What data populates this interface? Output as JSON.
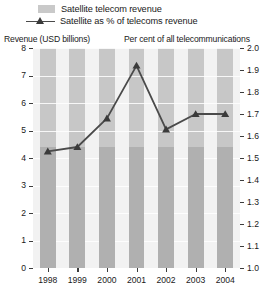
{
  "legend": {
    "items": [
      {
        "label": "Satellite telecom revenue",
        "marker": "bar-swatch"
      },
      {
        "label": "Satellite as % of telecoms revenue",
        "marker": "line-triangle-marker"
      }
    ]
  },
  "axes": {
    "left_caption": "Revenue (USD billions)",
    "right_caption": "Per cent of all telecommunications",
    "left_ticks": [
      "0",
      "1",
      "2",
      "3",
      "4",
      "5",
      "6",
      "7",
      "8"
    ],
    "right_ticks": [
      "1.0",
      "1.1",
      "1.2",
      "1.3",
      "1.4",
      "1.5",
      "1.6",
      "1.7",
      "1.8",
      "1.9",
      "2.0"
    ],
    "x_ticks": [
      "1998",
      "1999",
      "2000",
      "2001",
      "2002",
      "2003",
      "2004"
    ]
  },
  "colors": {
    "bar_fill": "#b0b0b0",
    "plot_background": "#c7c7c7",
    "gap_fill": "#f2f2f2",
    "line": "#4a4a4a",
    "marker": "#3a3a3a",
    "axis": "#3d3d3d",
    "gridline": "#ffffff",
    "text": "#1a1a1a"
  },
  "chart_data": {
    "type": "bar",
    "title": "",
    "xlabel": "",
    "ylabel": "Revenue (USD billions)",
    "y2label": "Per cent of all telecommunications",
    "categories": [
      "1998",
      "1999",
      "2000",
      "2001",
      "2002",
      "2003",
      "2004"
    ],
    "ylim": [
      0,
      8
    ],
    "y2lim": [
      1.0,
      2.0
    ],
    "grid": true,
    "legend_position": "top",
    "series": [
      {
        "name": "Satellite telecom revenue",
        "type": "bar",
        "axis": "left",
        "unit": "USD billions",
        "values": [
          4.4,
          4.4,
          4.4,
          4.4,
          4.4,
          4.4,
          4.4
        ]
      },
      {
        "name": "Satellite as % of telecoms revenue",
        "type": "line",
        "axis": "right",
        "unit": "per cent",
        "marker": "triangle",
        "values": [
          1.53,
          1.55,
          1.68,
          1.92,
          1.63,
          1.7,
          1.7
        ]
      }
    ]
  }
}
